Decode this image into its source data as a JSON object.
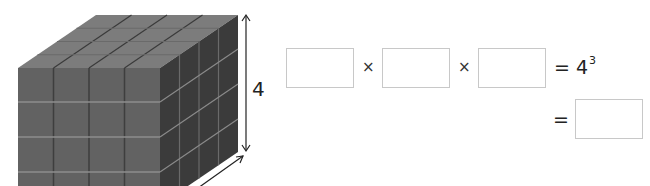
{
  "diagram": {
    "type": "cube-of-unit-cubes",
    "grid_size": 4,
    "dimension_label": "4",
    "colors": {
      "front_face": "#626262",
      "top_face": "#7c7c7c",
      "side_face": "#3b3b3b",
      "grid_line_front": "#8e8e8e",
      "grid_line_top": "#3a3a3a",
      "grid_line_side": "#6a6a6a"
    }
  },
  "equation": {
    "multiply_symbol": "×",
    "equals_symbol": "=",
    "power_base": "4",
    "power_exponent": "3",
    "boxes": [
      {
        "value": ""
      },
      {
        "value": ""
      },
      {
        "value": ""
      }
    ],
    "result_box": {
      "value": ""
    }
  }
}
